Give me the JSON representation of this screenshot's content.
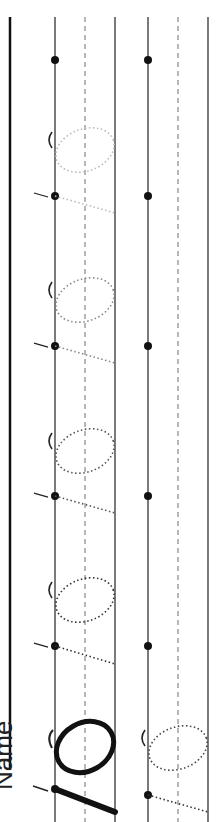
{
  "worksheet": {
    "name_label": "Name",
    "digit": "10",
    "orientation": "rotated-90-ccw",
    "colors": {
      "ink": "#111111",
      "guide": "#333333",
      "dashed": "#888888",
      "trace_dark": "#333333",
      "trace_light": "#bbbbbb"
    },
    "rows": [
      {
        "id": "row-1",
        "top_line_x": 55,
        "mid_line_x": 85,
        "base_line_x": 115,
        "start_dots_y": [
          60,
          196,
          346,
          496,
          646,
          793
        ],
        "model": {
          "label": "10",
          "style": "solid"
        },
        "traces": 4
      },
      {
        "id": "row-2",
        "top_line_x": 148,
        "mid_line_x": 178,
        "base_line_x": 208,
        "start_dots_y": [
          60,
          196,
          346,
          496,
          646,
          795
        ],
        "traces": 1
      }
    ]
  }
}
